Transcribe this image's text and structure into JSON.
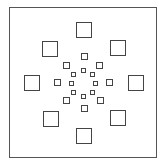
{
  "diagram": {
    "type": "concentric-square-pattern",
    "frame": {
      "x": 9,
      "y": 7,
      "w": 148,
      "h": 151,
      "color": "#555555"
    },
    "stroke_color": "#444444",
    "center": {
      "x": 83,
      "y": 83
    },
    "rings": [
      {
        "name": "outer",
        "size": 16,
        "squares": [
          {
            "pos": "top",
            "x": 76,
            "y": 22
          },
          {
            "pos": "upper-right",
            "x": 110,
            "y": 40
          },
          {
            "pos": "right",
            "x": 128,
            "y": 75
          },
          {
            "pos": "lower-right",
            "x": 110,
            "y": 110
          },
          {
            "pos": "bottom",
            "x": 76,
            "y": 128
          },
          {
            "pos": "lower-left",
            "x": 43,
            "y": 111
          },
          {
            "pos": "left",
            "x": 24,
            "y": 75
          },
          {
            "pos": "upper-left",
            "x": 42,
            "y": 41
          }
        ]
      },
      {
        "name": "middle",
        "size": 7,
        "squares": [
          {
            "pos": "top",
            "x": 81,
            "y": 53
          },
          {
            "pos": "upper-right",
            "x": 96,
            "y": 62
          },
          {
            "pos": "right",
            "x": 106,
            "y": 79
          },
          {
            "pos": "lower-right",
            "x": 97,
            "y": 97
          },
          {
            "pos": "bottom",
            "x": 81,
            "y": 105
          },
          {
            "pos": "lower-left",
            "x": 63,
            "y": 97
          },
          {
            "pos": "left",
            "x": 54,
            "y": 79
          },
          {
            "pos": "upper-left",
            "x": 63,
            "y": 62
          }
        ]
      },
      {
        "name": "inner",
        "size": 5,
        "squares": [
          {
            "pos": "top",
            "x": 81,
            "y": 68
          },
          {
            "pos": "upper-right",
            "x": 90,
            "y": 72
          },
          {
            "pos": "right",
            "x": 93,
            "y": 81
          },
          {
            "pos": "lower-right",
            "x": 90,
            "y": 90
          },
          {
            "pos": "bottom",
            "x": 81,
            "y": 94
          },
          {
            "pos": "lower-left",
            "x": 71,
            "y": 90
          },
          {
            "pos": "left",
            "x": 69,
            "y": 81
          },
          {
            "pos": "upper-left",
            "x": 71,
            "y": 72
          }
        ]
      }
    ],
    "counts": {
      "outer": 8,
      "middle": 8,
      "inner": 8,
      "total": 24
    }
  }
}
